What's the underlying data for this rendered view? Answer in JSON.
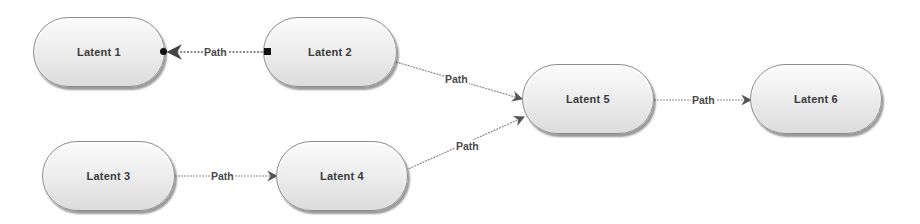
{
  "diagram": {
    "type": "path-diagram",
    "nodes": [
      {
        "id": "latent1",
        "label": "Latent 1",
        "x": 33,
        "y": 17,
        "w": 132,
        "h": 70
      },
      {
        "id": "latent2",
        "label": "Latent 2",
        "x": 263,
        "y": 17,
        "w": 134,
        "h": 70
      },
      {
        "id": "latent3",
        "label": "Latent 3",
        "x": 42,
        "y": 141,
        "w": 133,
        "h": 70
      },
      {
        "id": "latent4",
        "label": "Latent 4",
        "x": 276,
        "y": 141,
        "w": 132,
        "h": 70
      },
      {
        "id": "latent5",
        "label": "Latent 5",
        "x": 522,
        "y": 64,
        "w": 132,
        "h": 70
      },
      {
        "id": "latent6",
        "label": "Latent 6",
        "x": 750,
        "y": 64,
        "w": 132,
        "h": 70
      }
    ],
    "edges": [
      {
        "id": "edge-2-1",
        "from": "Latent 2",
        "to": "Latent 1",
        "label": "Path",
        "selected": true
      },
      {
        "id": "edge-2-5",
        "from": "Latent 2",
        "to": "Latent 5",
        "label": "Path",
        "selected": false
      },
      {
        "id": "edge-3-4",
        "from": "Latent 3",
        "to": "Latent 4",
        "label": "Path",
        "selected": false
      },
      {
        "id": "edge-4-5",
        "from": "Latent 4",
        "to": "Latent 5",
        "label": "Path",
        "selected": false
      },
      {
        "id": "edge-5-6",
        "from": "Latent 5",
        "to": "Latent 6",
        "label": "Path",
        "selected": false
      }
    ]
  },
  "colors": {
    "edge": "#8a8a8a",
    "edge_selected": "#6a6a6a",
    "arrowhead": "#555555",
    "node_border": "#8c8c8c",
    "node_text": "#3a3a3a",
    "handle": "#111111"
  }
}
